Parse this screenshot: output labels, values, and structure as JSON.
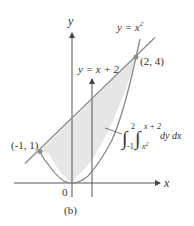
{
  "figure": {
    "caption": "(b)",
    "axes": {
      "x_label": "x",
      "y_label": "y",
      "origin_label": "0"
    },
    "curves": [
      {
        "name": "parabola",
        "label_lhs": "y = x",
        "label_exp": "2"
      },
      {
        "name": "line",
        "label": "y = x + 2"
      }
    ],
    "points": [
      {
        "label": "(2, 4)",
        "x": 2,
        "y": 4
      },
      {
        "label": "(-1, 1)",
        "x": -1,
        "y": 1
      }
    ],
    "integral": {
      "outer_upper": "2",
      "outer_lower": "-1",
      "inner_upper": "x + 2",
      "inner_lower": "x",
      "inner_lower_exp": "2",
      "differentials": "dy dx"
    },
    "colors": {
      "region_fill": "#e6e6e6",
      "curve": "#8a8a8a",
      "axis": "#555555",
      "point": "#8a8a8a"
    }
  }
}
